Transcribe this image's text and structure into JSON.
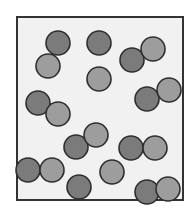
{
  "diagram": {
    "box": {
      "x": 17,
      "y": 17,
      "width": 166,
      "height": 183,
      "fill": "#f1f1f1",
      "stroke": "#333333"
    },
    "particle_radius": 12,
    "colors": {
      "dark": "#7b7b7b",
      "light": "#9d9d9d",
      "outline": "#2e2e2e"
    },
    "particles": [
      {
        "x": 58,
        "y": 43,
        "type": "dark"
      },
      {
        "x": 48,
        "y": 66,
        "type": "light"
      },
      {
        "x": 99,
        "y": 43,
        "type": "dark"
      },
      {
        "x": 99,
        "y": 79,
        "type": "light"
      },
      {
        "x": 132,
        "y": 60,
        "type": "dark"
      },
      {
        "x": 153,
        "y": 49,
        "type": "light"
      },
      {
        "x": 147,
        "y": 99,
        "type": "dark"
      },
      {
        "x": 169,
        "y": 90,
        "type": "light"
      },
      {
        "x": 38,
        "y": 103,
        "type": "dark"
      },
      {
        "x": 58,
        "y": 114,
        "type": "light"
      },
      {
        "x": 76,
        "y": 147,
        "type": "dark"
      },
      {
        "x": 96,
        "y": 135,
        "type": "light"
      },
      {
        "x": 131,
        "y": 148,
        "type": "dark"
      },
      {
        "x": 155,
        "y": 148,
        "type": "light"
      },
      {
        "x": 28,
        "y": 170,
        "type": "dark"
      },
      {
        "x": 52,
        "y": 170,
        "type": "light"
      },
      {
        "x": 112,
        "y": 172,
        "type": "light"
      },
      {
        "x": 79,
        "y": 187,
        "type": "dark"
      },
      {
        "x": 147,
        "y": 192,
        "type": "dark"
      },
      {
        "x": 168,
        "y": 189,
        "type": "light"
      }
    ]
  }
}
